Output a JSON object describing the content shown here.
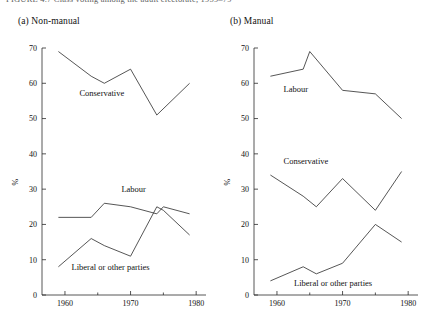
{
  "figure": {
    "caption_partial": "FIGURE 4.7   Class voting among the adult electorate, 1959–79",
    "ylabel": "%",
    "y_ticks": [
      0,
      10,
      20,
      30,
      40,
      50,
      60,
      70
    ],
    "x_ticks_major": [
      1960,
      1970,
      1980
    ],
    "x_ticks_minor": [
      1965,
      1975
    ],
    "ylim": [
      0,
      70
    ],
    "xlim": [
      1956.5,
      1981.5
    ],
    "line_color": "#2b2b2b",
    "background": "#ffffff"
  },
  "chart_data": [
    {
      "type": "line",
      "panel_id": "a",
      "title": "(a)  Non-manual",
      "xlabel": "",
      "ylabel": "%",
      "ylim": [
        0,
        70
      ],
      "xlim": [
        1956.5,
        1981.5
      ],
      "grid": false,
      "legend": "inline-labels",
      "x": [
        1959,
        1964,
        1966,
        1970,
        1974,
        1975,
        1979
      ],
      "series": [
        {
          "name": "Conservative",
          "label": "Conservative",
          "label_x": 1962.2,
          "label_y": 56.5,
          "x": [
            1959,
            1964,
            1966,
            1970,
            1974,
            1979
          ],
          "values": [
            69,
            62,
            60,
            64,
            51,
            60
          ]
        },
        {
          "name": "Labour",
          "label": "Labour",
          "label_x": 1968.6,
          "label_y": 29.2,
          "x": [
            1959,
            1964,
            1966,
            1970,
            1974,
            1975,
            1979
          ],
          "values": [
            22,
            22,
            26,
            25,
            23,
            25,
            23
          ]
        },
        {
          "name": "Liberal or other parties",
          "label": "Liberal or other parties",
          "label_x": 1961.0,
          "label_y": 7.2,
          "x": [
            1959,
            1964,
            1966,
            1970,
            1974,
            1975,
            1979
          ],
          "values": [
            8,
            16,
            14,
            11,
            25,
            24,
            17
          ]
        }
      ]
    },
    {
      "type": "line",
      "panel_id": "b",
      "title": "(b)  Manual",
      "xlabel": "",
      "ylabel": "%",
      "ylim": [
        0,
        70
      ],
      "xlim": [
        1956.5,
        1981.5
      ],
      "grid": false,
      "legend": "inline-labels",
      "x": [
        1959,
        1964,
        1965,
        1970,
        1975,
        1979
      ],
      "series": [
        {
          "name": "Labour",
          "label": "Labour",
          "label_x": 1961.0,
          "label_y": 57.5,
          "x": [
            1959,
            1964,
            1965,
            1970,
            1975,
            1979
          ],
          "values": [
            62,
            64,
            69,
            58,
            57,
            50
          ]
        },
        {
          "name": "Conservative",
          "label": "Conservative",
          "label_x": 1961.0,
          "label_y": 37.0,
          "x": [
            1959,
            1964,
            1966,
            1970,
            1975,
            1979
          ],
          "values": [
            34,
            28,
            25,
            33,
            24,
            35
          ]
        },
        {
          "name": "Liberal or other parties",
          "label": "Liberal or other parties",
          "label_x": 1962.6,
          "label_y": 2.6,
          "x": [
            1959,
            1964,
            1966,
            1970,
            1975,
            1979
          ],
          "values": [
            4,
            8,
            6,
            9,
            20,
            15
          ]
        }
      ]
    }
  ]
}
